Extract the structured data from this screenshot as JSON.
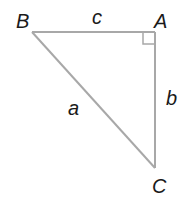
{
  "diagram": {
    "type": "right-triangle",
    "colors": {
      "line": "#a8a8a8",
      "text": "#1a1a1a",
      "background": "#ffffff"
    },
    "vertices": [
      {
        "id": "B",
        "label": "B",
        "x": 32,
        "y": 32
      },
      {
        "id": "A",
        "label": "A",
        "x": 155,
        "y": 32
      },
      {
        "id": "C",
        "label": "C",
        "x": 155,
        "y": 168
      }
    ],
    "sides": [
      {
        "id": "c",
        "label": "c",
        "from": "B",
        "to": "A"
      },
      {
        "id": "b",
        "label": "b",
        "from": "A",
        "to": "C"
      },
      {
        "id": "a",
        "label": "a",
        "from": "B",
        "to": "C"
      }
    ],
    "right_angle_at": "A"
  }
}
